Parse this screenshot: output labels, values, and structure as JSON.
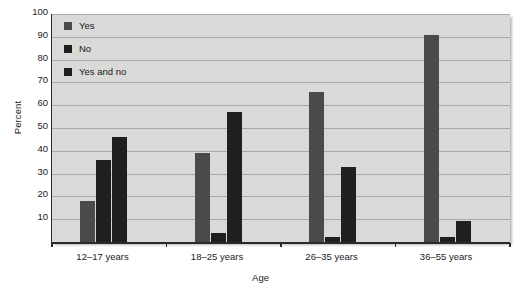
{
  "chart_data": {
    "type": "bar",
    "title": "",
    "xlabel": "Age",
    "ylabel": "Percent",
    "ylim": [
      0,
      100
    ],
    "yticks": [
      10,
      20,
      30,
      40,
      50,
      60,
      70,
      80,
      90,
      100
    ],
    "grid": true,
    "legend_position": "top-left",
    "categories": [
      "12–17 years",
      "18–25 years",
      "26–35 years",
      "36–55 years"
    ],
    "series": [
      {
        "name": "Yes",
        "color": "#4a4a4a",
        "values": [
          18,
          39,
          66,
          91
        ]
      },
      {
        "name": "No",
        "color": "#1f1f1f",
        "values": [
          36,
          4,
          2,
          2
        ]
      },
      {
        "name": "Yes and no",
        "color": "#1f1f1f",
        "values": [
          46,
          57,
          33,
          9
        ]
      }
    ]
  },
  "colors": {
    "plot_background": "#d9d9d7",
    "gridline": "#a9a9a6",
    "axis": "#2a2a2a",
    "text": "#1a1a1a"
  }
}
